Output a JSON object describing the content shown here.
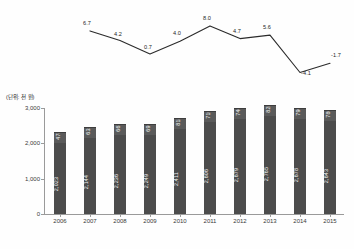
{
  "chart_data": [
    {
      "type": "line",
      "title": "",
      "xlabel": "",
      "ylabel": "",
      "grid": false,
      "legend": "none",
      "categories": [
        "2007",
        "2008",
        "2009",
        "2010",
        "2011",
        "2012",
        "2013",
        "2014",
        "2015"
      ],
      "values": [
        6.7,
        4.2,
        0.7,
        4.0,
        8.0,
        4.7,
        5.6,
        -4.1,
        -1.7
      ],
      "value_labels": [
        "6.7",
        "4.2",
        "0.7",
        "4.0",
        "8.0",
        "4.7",
        "5.6",
        "-4.1",
        "-1.7"
      ],
      "ylim": [
        -5.0,
        9.0
      ],
      "series": [
        {
          "name": "growth-rate",
          "values": [
            6.7,
            4.2,
            0.7,
            4.0,
            8.0,
            4.7,
            5.6,
            -4.1,
            -1.7
          ]
        }
      ]
    },
    {
      "type": "bar",
      "stacked": true,
      "unit_label": "(단위: 천 원)",
      "title": "",
      "xlabel": "",
      "ylabel": "",
      "grid": false,
      "legend": "none",
      "ylim": [
        0,
        3000
      ],
      "yticks": [
        0,
        1000,
        2000,
        3000
      ],
      "ytick_labels": [
        "0",
        "1,000",
        "2,000",
        "3,000"
      ],
      "categories": [
        "2006",
        "2007",
        "2008",
        "2009",
        "2010",
        "2011",
        "2012",
        "2013",
        "2014",
        "2015"
      ],
      "series": [
        {
          "name": "main",
          "values": [
            2023,
            2144,
            2236,
            2249,
            2411,
            2606,
            2679,
            2765,
            2678,
            2643
          ],
          "value_labels": [
            "2,023",
            "2,144",
            "2,236",
            "2,249",
            "2,411",
            "2,606",
            "2,679",
            "2,765",
            "2,678",
            "2,643"
          ]
        },
        {
          "name": "top",
          "values": [
            478,
            633,
            667,
            691,
            818,
            710,
            746,
            828,
            790,
            786
          ],
          "value_labels": [
            "478",
            "633",
            "667",
            "691",
            "818",
            "710",
            "746",
            "828",
            "790",
            "786"
          ]
        }
      ]
    }
  ],
  "colors": {
    "bar_main": "#4c4c4c",
    "bar_top": "#5a5a5a",
    "line": "#2b2b2b",
    "axis": "#9a9a9a",
    "text": "#2b2b2b",
    "bar_text": "#f2f2f2"
  }
}
